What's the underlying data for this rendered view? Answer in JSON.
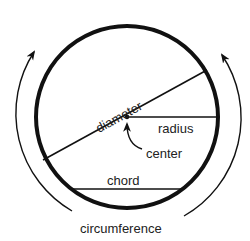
{
  "diagram": {
    "labels": {
      "diameter": "diameter",
      "radius": "radius",
      "center": "center",
      "chord": "chord",
      "circumference": "circumference"
    },
    "colors": {
      "stroke": "#111111",
      "text": "#222222",
      "background": "#ffffff"
    }
  }
}
